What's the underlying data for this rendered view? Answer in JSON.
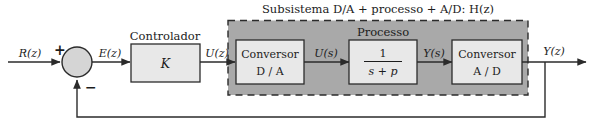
{
  "diagram": {
    "kind": "control-system-block-diagram",
    "language": "pt",
    "subsystem_title": "Subsistema D/A + processo + A/D:  H(z)",
    "captions": {
      "controller": "Controlador",
      "process": "Processo"
    },
    "signals": {
      "reference": "R(z)",
      "error": "E(z)",
      "controller_output": "U(z)",
      "dac_output": "U(s)",
      "process_output": "Y(s)",
      "output": "Y(z)"
    },
    "signs": {
      "positive": "+",
      "negative": "−"
    },
    "blocks": [
      {
        "id": "controller",
        "label_line1": "K",
        "label_line2": ""
      },
      {
        "id": "dac",
        "label_line1": "Conversor",
        "label_line2": "D / A"
      },
      {
        "id": "process",
        "numerator": "1",
        "denominator": "s + p"
      },
      {
        "id": "adc",
        "label_line1": "Conversor",
        "label_line2": "A / D"
      }
    ],
    "colors": {
      "block_fill": "#e8e8e8",
      "subsystem_fill": "#a9a9a9",
      "summing_fill": "#d5d5d5",
      "line": "#2b2b2b",
      "background": "#ffffff"
    }
  }
}
